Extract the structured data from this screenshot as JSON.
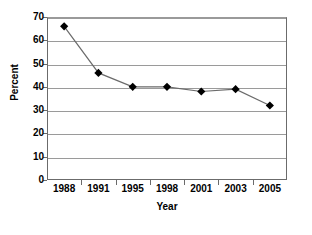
{
  "chart_data": {
    "type": "line",
    "title": "",
    "xlabel": "Year",
    "ylabel": "Percent",
    "categories": [
      "1988",
      "1991",
      "1995",
      "1998",
      "2001",
      "2003",
      "2005"
    ],
    "values": [
      66,
      46,
      40,
      40,
      38,
      39,
      32
    ],
    "series": [
      {
        "name": "Percent",
        "values": [
          66,
          46,
          40,
          40,
          38,
          39,
          32
        ]
      }
    ],
    "ylim": [
      0,
      70
    ],
    "ytick_labels": [
      "0",
      "10",
      "20",
      "30",
      "40",
      "50",
      "60",
      "70"
    ],
    "ytick_values": [
      0,
      10,
      20,
      30,
      40,
      50,
      60,
      70
    ],
    "grid": "horizontal",
    "legend": "none",
    "marker": "diamond",
    "marker_color": "#000000",
    "line_color": "#6b6b6b"
  },
  "axes": {
    "y_title": "Percent",
    "x_title": "Year"
  }
}
